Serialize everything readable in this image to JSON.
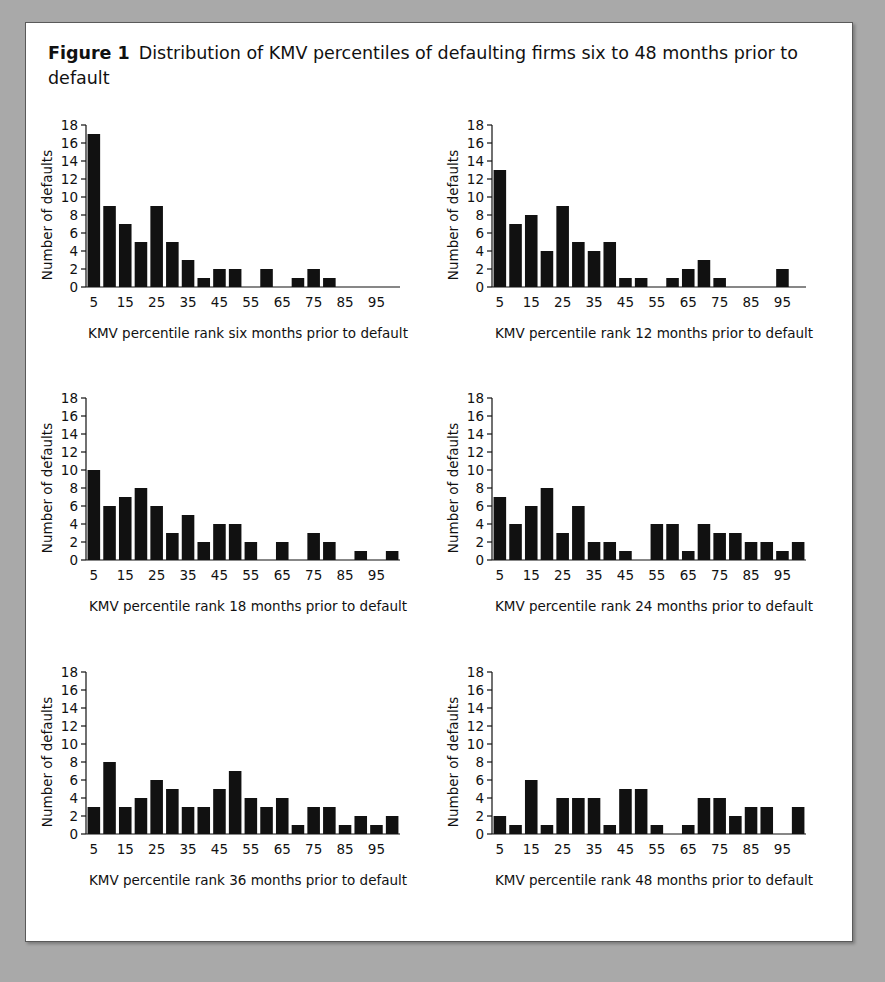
{
  "figure": {
    "number_label": "Figure 1",
    "caption": "Distribution of KMV percentiles of defaulting firms six to 48 months prior to default"
  },
  "axes_common": {
    "ylabel": "Number of defaults",
    "ytick_labels": [
      "0",
      "2",
      "4",
      "6",
      "8",
      "10",
      "12",
      "14",
      "16",
      "18"
    ],
    "xtick_labels": [
      "5",
      "15",
      "25",
      "35",
      "45",
      "55",
      "65",
      "75",
      "85",
      "95"
    ]
  },
  "chart_data": [
    {
      "type": "bar",
      "panel": "six-months",
      "title": "",
      "xlabel": "KMV percentile rank six months prior to default",
      "ylabel": "Number of defaults",
      "categories": [
        5,
        10,
        15,
        20,
        25,
        30,
        35,
        40,
        45,
        50,
        55,
        60,
        65,
        70,
        75,
        80,
        85,
        90,
        95,
        100
      ],
      "xtick_values": [
        5,
        15,
        25,
        35,
        45,
        55,
        65,
        75,
        85,
        95
      ],
      "values": [
        17,
        9,
        7,
        5,
        9,
        5,
        3,
        1,
        2,
        2,
        0,
        2,
        0,
        1,
        2,
        1,
        0,
        0,
        0,
        0
      ],
      "ylim": [
        0,
        18
      ],
      "ytick_step": 2,
      "grid": false,
      "legend": "none"
    },
    {
      "type": "bar",
      "panel": "12-months",
      "title": "",
      "xlabel": "KMV percentile rank 12 months prior to default",
      "ylabel": "Number of defaults",
      "categories": [
        5,
        10,
        15,
        20,
        25,
        30,
        35,
        40,
        45,
        50,
        55,
        60,
        65,
        70,
        75,
        80,
        85,
        90,
        95,
        100
      ],
      "xtick_values": [
        5,
        15,
        25,
        35,
        45,
        55,
        65,
        75,
        85,
        95
      ],
      "values": [
        13,
        7,
        8,
        4,
        9,
        5,
        4,
        5,
        1,
        1,
        0,
        1,
        2,
        3,
        1,
        0,
        0,
        0,
        2,
        0
      ],
      "ylim": [
        0,
        18
      ],
      "ytick_step": 2,
      "grid": false,
      "legend": "none"
    },
    {
      "type": "bar",
      "panel": "18-months",
      "title": "",
      "xlabel": "KMV percentile rank 18 months prior to default",
      "ylabel": "Number of defaults",
      "categories": [
        5,
        10,
        15,
        20,
        25,
        30,
        35,
        40,
        45,
        50,
        55,
        60,
        65,
        70,
        75,
        80,
        85,
        90,
        95,
        100
      ],
      "xtick_values": [
        5,
        15,
        25,
        35,
        45,
        55,
        65,
        75,
        85,
        95
      ],
      "values": [
        10,
        6,
        7,
        8,
        6,
        3,
        5,
        2,
        4,
        4,
        2,
        0,
        2,
        0,
        3,
        2,
        0,
        1,
        0,
        1
      ],
      "ylim": [
        0,
        18
      ],
      "ytick_step": 2,
      "grid": false,
      "legend": "none"
    },
    {
      "type": "bar",
      "panel": "24-months",
      "title": "",
      "xlabel": "KMV percentile rank 24 months prior to default",
      "ylabel": "Number of defaults",
      "categories": [
        5,
        10,
        15,
        20,
        25,
        30,
        35,
        40,
        45,
        50,
        55,
        60,
        65,
        70,
        75,
        80,
        85,
        90,
        95,
        100
      ],
      "xtick_values": [
        5,
        15,
        25,
        35,
        45,
        55,
        65,
        75,
        85,
        95
      ],
      "values": [
        7,
        4,
        6,
        8,
        3,
        6,
        2,
        2,
        1,
        0,
        4,
        4,
        1,
        4,
        3,
        3,
        2,
        2,
        1,
        2
      ],
      "ylim": [
        0,
        18
      ],
      "ytick_step": 2,
      "grid": false,
      "legend": "none"
    },
    {
      "type": "bar",
      "panel": "36-months",
      "title": "",
      "xlabel": "KMV percentile rank 36 months prior to default",
      "ylabel": "Number of defaults",
      "categories": [
        5,
        10,
        15,
        20,
        25,
        30,
        35,
        40,
        45,
        50,
        55,
        60,
        65,
        70,
        75,
        80,
        85,
        90,
        95,
        100
      ],
      "xtick_values": [
        5,
        15,
        25,
        35,
        45,
        55,
        65,
        75,
        85,
        95
      ],
      "values": [
        3,
        8,
        3,
        4,
        6,
        5,
        3,
        3,
        5,
        7,
        4,
        3,
        4,
        1,
        3,
        3,
        1,
        2,
        1,
        2
      ],
      "ylim": [
        0,
        18
      ],
      "ytick_step": 2,
      "grid": false,
      "legend": "none"
    },
    {
      "type": "bar",
      "panel": "48-months",
      "title": "",
      "xlabel": "KMV percentile rank 48 months prior to default",
      "ylabel": "Number of defaults",
      "categories": [
        5,
        10,
        15,
        20,
        25,
        30,
        35,
        40,
        45,
        50,
        55,
        60,
        65,
        70,
        75,
        80,
        85,
        90,
        95,
        100
      ],
      "xtick_values": [
        5,
        15,
        25,
        35,
        45,
        55,
        65,
        75,
        85,
        95
      ],
      "values": [
        2,
        1,
        6,
        1,
        4,
        4,
        4,
        1,
        5,
        5,
        1,
        0,
        1,
        4,
        4,
        2,
        3,
        3,
        0,
        3
      ],
      "ylim": [
        0,
        18
      ],
      "ytick_step": 2,
      "grid": false,
      "legend": "none"
    }
  ],
  "colors": {
    "bar": "#111111",
    "axis": "#111111",
    "panel_background": "#ffffff",
    "page_background": "#a9a9a9",
    "panel_border": "#5a5a5a",
    "text": "#111111"
  }
}
